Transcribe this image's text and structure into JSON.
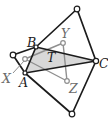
{
  "diagram": {
    "background": "#ffffff",
    "colors": {
      "primary_line": "#1c1c1c",
      "secondary_line": "#8f8f8f",
      "region_fill": "#d8d8d8",
      "label_dark": "#1c1c1c",
      "label_gray": "#6a6a6a",
      "circle_fill": "#ffffff"
    },
    "points": {
      "A": [
        25,
        73
      ],
      "B": [
        36,
        47
      ],
      "C": [
        96,
        61
      ],
      "P1": [
        77,
        9
      ],
      "P2": [
        13,
        55
      ],
      "P3": [
        72,
        114
      ],
      "X": [
        25,
        59
      ],
      "Y": [
        63,
        43
      ],
      "Z": [
        67,
        81
      ]
    },
    "shaded_region": {
      "vertices": [
        "A",
        "B",
        "C"
      ],
      "label": "T"
    },
    "black_edges": [
      [
        "A",
        "B"
      ],
      [
        "B",
        "C"
      ],
      [
        "C",
        "A"
      ],
      [
        "B",
        "P1"
      ],
      [
        "C",
        "P1"
      ],
      [
        "A",
        "P2"
      ],
      [
        "B",
        "P2"
      ],
      [
        "A",
        "P3"
      ],
      [
        "C",
        "P3"
      ]
    ],
    "gray_edges": [
      [
        "X",
        "Y"
      ],
      [
        "Y",
        "Z"
      ],
      [
        "Z",
        "X"
      ]
    ],
    "leader_line": {
      "x1": 13,
      "y1": 73,
      "x2": 24,
      "y2": 61
    },
    "vertex_markers": [
      {
        "id": "P1",
        "tone": "dark",
        "r": 2.8
      },
      {
        "id": "P2",
        "tone": "dark",
        "r": 2.8
      },
      {
        "id": "P3",
        "tone": "dark",
        "r": 2.8
      },
      {
        "id": "C",
        "tone": "dark",
        "r": 2.6
      },
      {
        "id": "A",
        "tone": "dark",
        "r": 2.0
      },
      {
        "id": "B",
        "tone": "dark",
        "r": 2.0
      },
      {
        "id": "X",
        "tone": "gray",
        "r": 2.3
      },
      {
        "id": "Y",
        "tone": "gray",
        "r": 2.3
      },
      {
        "id": "Z",
        "tone": "gray",
        "r": 2.3
      }
    ],
    "labels": [
      {
        "text": "B",
        "x": 27,
        "y": 47,
        "tone": "dark"
      },
      {
        "text": "Y",
        "x": 61,
        "y": 38,
        "tone": "gray"
      },
      {
        "text": "T",
        "x": 47,
        "y": 62,
        "tone": "dark"
      },
      {
        "text": "C",
        "x": 99,
        "y": 68,
        "tone": "dark"
      },
      {
        "text": "X",
        "x": 2,
        "y": 83,
        "tone": "gray"
      },
      {
        "text": "A",
        "x": 19,
        "y": 87,
        "tone": "dark"
      },
      {
        "text": "Z",
        "x": 69,
        "y": 93,
        "tone": "gray"
      }
    ],
    "canvas": {
      "width": 108,
      "height": 127
    }
  }
}
